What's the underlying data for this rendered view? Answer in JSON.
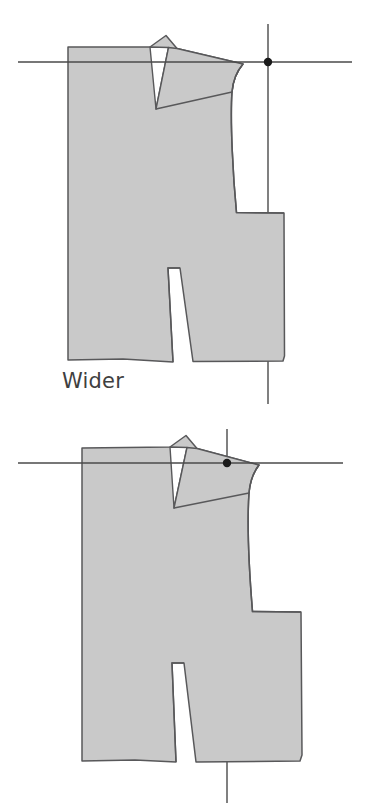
{
  "page": {
    "background_color": "#ffffff",
    "width": 367,
    "height": 809
  },
  "style": {
    "pattern_fill": "#c9c9c9",
    "pattern_stroke": "#58585a",
    "guideline_color": "#4a4a4a",
    "marker_color": "#1a1a1a",
    "caption_color": "#3f3f3f"
  },
  "figures": [
    {
      "id": "wider",
      "caption": "Wider",
      "icon_names": [
        "bodice-pattern-piece",
        "horizontal-guideline",
        "vertical-guideline",
        "shoulder-point-marker"
      ],
      "guides": {
        "horizontal_line": {
          "x1": 18,
          "y1": 62,
          "x2": 352,
          "y2": 62
        },
        "vertical_line": {
          "x1": 268,
          "y1": 24,
          "x2": 268,
          "y2": 404
        },
        "marker_point": {
          "x": 268,
          "y": 62,
          "r": 4.2
        }
      },
      "shapes": {
        "body": "M 68,47 L 68,360 L 123,359 L 173,362 L 168,268 L 180,268 L 193,362 L 272,361 L 284,360 L 283,213 L 236,212 C 233,175 230,120 232,92 C 233,79 238,70 243,64 L 176,48 L 166,36 L 150,47 Z",
        "dart": "M 156,109 L 168,47 L 150,47 Z",
        "notes": "Left panel with shoulder dart slit and center waist notch; armhole scoops in on the right"
      }
    },
    {
      "id": "narrower",
      "caption": "Narrower",
      "icon_names": [
        "bodice-pattern-piece",
        "horizontal-guideline",
        "vertical-guideline",
        "shoulder-point-marker"
      ],
      "guides": {
        "horizontal_line": {
          "x1": 18,
          "y1": 58,
          "x2": 343,
          "y2": 58
        },
        "vertical_line": {
          "x1": 227,
          "y1": 24,
          "x2": 227,
          "y2": 398
        },
        "marker_point": {
          "x": 227,
          "y": 58,
          "r": 4.2
        }
      },
      "shapes": {
        "body": "M 82,43 L 82,356 L 135,355 L 176,357 L 172,258 L 184,258 L 196,357 L 280,356 L 302,354 L 300,207 L 252,206 C 249,170 247,118 249,88 C 250,75 254,66 259,60 L 196,43 L 186,31 L 170,42 Z",
        "dart": "M 174,103 L 186,42 L 170,42 Z",
        "notes": "Same bodice piece with narrower armhole; shoulder point sits on the vertical guideline"
      }
    }
  ]
}
